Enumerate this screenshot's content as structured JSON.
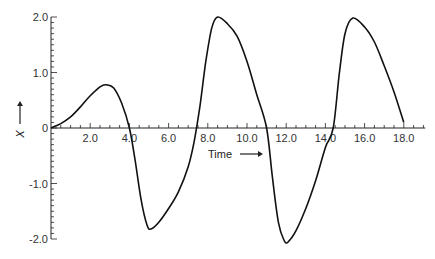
{
  "chart_data": {
    "type": "line",
    "title": "",
    "xlabel": "Time",
    "ylabel": "X",
    "xlim": [
      0,
      19
    ],
    "ylim": [
      -2.0,
      2.0
    ],
    "grid": false,
    "legend": null,
    "x_ticks": [
      "2.0",
      "4.0",
      "6.0",
      "8.0",
      "10.0",
      "12.0",
      "14.0",
      "16.0",
      "18.0"
    ],
    "y_ticks": [
      "2.0",
      "1.0",
      "0",
      "-1.0",
      "-2.0"
    ],
    "series": [
      {
        "name": "X(t)",
        "x": [
          0,
          0.5,
          1.0,
          1.5,
          2.0,
          2.5,
          2.8,
          3.2,
          3.6,
          4.0,
          4.3,
          4.6,
          4.9,
          5.1,
          5.5,
          6.0,
          6.5,
          7.0,
          7.3,
          7.6,
          7.9,
          8.2,
          8.5,
          9.0,
          9.5,
          10.0,
          10.5,
          11.0,
          11.3,
          11.6,
          11.9,
          12.1,
          12.5,
          13.0,
          13.5,
          14.0,
          14.4,
          14.7,
          15.0,
          15.4,
          16.0,
          16.5,
          17.0,
          17.5,
          18.0
        ],
        "y": [
          0,
          0.08,
          0.2,
          0.38,
          0.58,
          0.74,
          0.78,
          0.72,
          0.45,
          0.0,
          -0.6,
          -1.3,
          -1.75,
          -1.82,
          -1.7,
          -1.45,
          -1.15,
          -0.7,
          -0.25,
          0.4,
          1.2,
          1.8,
          2.0,
          1.88,
          1.65,
          1.2,
          0.6,
          0.0,
          -0.9,
          -1.7,
          -2.03,
          -2.05,
          -1.85,
          -1.45,
          -0.95,
          -0.35,
          0.0,
          0.95,
          1.7,
          1.98,
          1.82,
          1.55,
          1.12,
          0.65,
          0.1
        ]
      }
    ]
  },
  "axes": {
    "x_label": "Time",
    "x_arrow": "→",
    "y_label": "X",
    "y_arrow": "↑"
  }
}
